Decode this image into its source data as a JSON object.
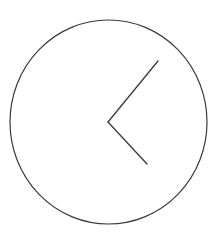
{
  "diagram": {
    "type": "clock-face",
    "stroke_color": "#3a3a3a",
    "background": "#ffffff",
    "face": {
      "cx": 108.5,
      "cy": 122,
      "rx": 98.5,
      "ry": 102
    },
    "hands": [
      {
        "name": "upper-hand",
        "x1": 108,
        "y1": 122,
        "x2": 158,
        "y2": 61
      },
      {
        "name": "lower-hand",
        "x1": 108,
        "y1": 122,
        "x2": 147,
        "y2": 164
      }
    ]
  }
}
